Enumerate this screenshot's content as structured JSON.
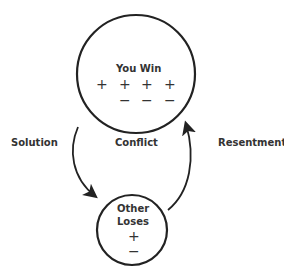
{
  "diagram": {
    "top_node": {
      "title": "You Win",
      "plus_row": [
        "+",
        "+",
        "+",
        "+"
      ],
      "minus_row": [
        "−",
        "−",
        "−"
      ]
    },
    "bottom_node": {
      "title_line1": "Other",
      "title_line2": "Loses",
      "plus": "+",
      "minus": "−"
    },
    "center_label": "Conflict",
    "left_arrow_label": "Solution",
    "right_arrow_label": "Resentment",
    "colors": {
      "stroke": "#222222",
      "background": "#ffffff"
    }
  }
}
